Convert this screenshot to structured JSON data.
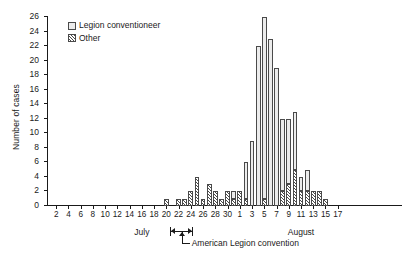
{
  "chart_data": {
    "type": "bar",
    "title": "",
    "xlabel": "",
    "ylabel": "Number of cases",
    "ylim": [
      0,
      26
    ],
    "ystep": 2,
    "grid": false,
    "stacked": true,
    "legend_position": "top-left",
    "legend": [
      "Legion conventioneer",
      "Other"
    ],
    "series": [
      {
        "name": "Legion conventioneer",
        "swatch": "plain",
        "values": [
          0,
          0,
          0,
          0,
          0,
          0,
          0,
          0,
          0,
          0,
          0,
          0,
          0,
          0,
          0,
          0,
          0,
          0,
          0,
          0,
          0,
          0,
          0,
          0,
          0,
          0,
          0,
          0,
          0,
          0,
          1,
          0,
          5,
          9,
          22,
          25,
          23,
          19,
          10,
          9,
          8,
          2,
          3,
          0,
          0,
          0,
          0,
          0,
          0,
          0,
          0,
          0,
          0,
          0,
          0,
          0,
          0,
          0
        ]
      },
      {
        "name": "Other",
        "swatch": "hatch",
        "values": [
          0,
          0,
          0,
          0,
          0,
          0,
          0,
          0,
          0,
          0,
          0,
          0,
          0,
          0,
          0,
          0,
          0,
          0,
          0,
          1,
          0,
          1,
          1,
          2,
          4,
          1,
          3,
          2,
          1,
          2,
          1,
          2,
          1,
          0,
          0,
          1,
          0,
          0,
          2,
          3,
          5,
          2,
          2,
          2,
          2,
          1,
          0,
          0,
          0,
          0,
          0,
          0,
          0,
          0,
          0,
          0,
          0,
          0
        ]
      }
    ],
    "categories": [
      "1",
      "2",
      "3",
      "4",
      "5",
      "6",
      "7",
      "8",
      "9",
      "10",
      "11",
      "12",
      "13",
      "14",
      "15",
      "16",
      "17",
      "18",
      "19",
      "20",
      "21",
      "22",
      "23",
      "24",
      "25",
      "26",
      "27",
      "28",
      "29",
      "30",
      "31",
      "1",
      "2",
      "3",
      "4",
      "5",
      "6",
      "7",
      "8",
      "9",
      "10",
      "11",
      "12",
      "13",
      "14",
      "15",
      "16",
      "17",
      "18",
      "19",
      "20",
      "21",
      "22",
      "23",
      "24",
      "25",
      "26",
      "27"
    ],
    "x_tick_labels": [
      "2",
      "4",
      "6",
      "8",
      "10",
      "12",
      "14",
      "16",
      "18",
      "20",
      "22",
      "24",
      "26",
      "28",
      "30",
      "1",
      "3",
      "5",
      "7",
      "9",
      "11",
      "13",
      "15",
      "17"
    ],
    "x_tick_indices": [
      1,
      3,
      5,
      7,
      9,
      11,
      13,
      15,
      17,
      19,
      21,
      23,
      25,
      27,
      29,
      31,
      33,
      35,
      37,
      39,
      41,
      43,
      45,
      47
    ],
    "y_tick_labels": [
      "0",
      "2",
      "4",
      "6",
      "8",
      "10",
      "12",
      "14",
      "16",
      "18",
      "20",
      "22",
      "24",
      "26"
    ],
    "months": [
      {
        "label": "July",
        "center_index": 15
      },
      {
        "label": "August",
        "center_index": 41
      }
    ],
    "annotations": [
      {
        "label": "American Legion convention",
        "span_start_index": 20,
        "span_end_index": 23
      }
    ],
    "colors": {
      "axis": "#1a1a1a",
      "bar_outline": "#4a4a4a",
      "plain_fill": "#ececec",
      "hatch_fill": "#ffffff"
    }
  }
}
